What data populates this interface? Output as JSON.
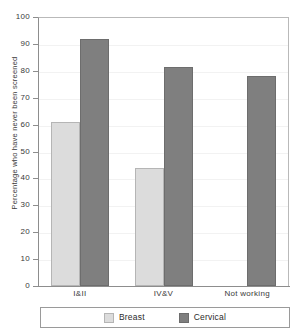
{
  "chart_data": {
    "type": "bar",
    "title": "",
    "xlabel": "",
    "ylabel": "Percentage who have never been screened",
    "ylim": [
      0,
      100
    ],
    "ytick_step": 10,
    "yticks": [
      100,
      90,
      80,
      70,
      60,
      50,
      40,
      30,
      20,
      10,
      0
    ],
    "categories": [
      "I&II",
      "IV&V",
      "Not working"
    ],
    "grid": true,
    "legend_position": "bottom",
    "series": [
      {
        "name": "Breast",
        "color": "#dcdcdc",
        "values": [
          61,
          44,
          null
        ]
      },
      {
        "name": "Cervical",
        "color": "#7f7f7f",
        "values": [
          92,
          81.5,
          78
        ]
      }
    ]
  },
  "axis": {
    "y_title": "Percentage who have never been screened",
    "tick_labels": [
      "100",
      "90",
      "80",
      "70",
      "60",
      "50",
      "40",
      "30",
      "20",
      "10",
      "0"
    ]
  },
  "categories": [
    {
      "label": "I&II"
    },
    {
      "label": "IV&V"
    },
    {
      "label": "Not working"
    }
  ],
  "legend": {
    "items": [
      {
        "label": "Breast",
        "color": "#dcdcdc",
        "swatch": "breast-swatch"
      },
      {
        "label": "Cervical",
        "color": "#7f7f7f",
        "swatch": "cervical-swatch"
      }
    ]
  }
}
